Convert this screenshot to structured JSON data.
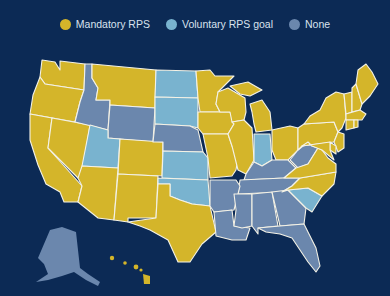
{
  "legend": {
    "items": [
      {
        "label": "Mandatory RPS",
        "color": "#d4b52a",
        "icon": "yellow-dot-icon"
      },
      {
        "label": "Voluntary RPS goal",
        "color": "#79b3cf",
        "icon": "light-blue-dot-icon"
      },
      {
        "label": "None",
        "color": "#6b87ad",
        "icon": "slate-blue-dot-icon"
      }
    ]
  },
  "colors": {
    "background": "#0c2a55",
    "mandatory": "#d4b52a",
    "voluntary": "#79b3cf",
    "none": "#6b87ad",
    "border": "#f4f2e6"
  },
  "states": {
    "mandatory": [
      "WA",
      "OR",
      "CA",
      "NV",
      "AZ",
      "NM",
      "MT",
      "CO",
      "TX",
      "MN",
      "IA",
      "MO",
      "WI",
      "IL",
      "MI",
      "OH",
      "PA",
      "NY",
      "ME",
      "NH",
      "VT",
      "MA",
      "RI",
      "CT",
      "NJ",
      "DE",
      "MD",
      "DC",
      "NC",
      "HI"
    ],
    "voluntary": [
      "UT",
      "ND",
      "SD",
      "KS",
      "OK",
      "IN",
      "SC"
    ],
    "none": [
      "ID",
      "WY",
      "NE",
      "AR",
      "LA",
      "KY",
      "TN",
      "MS",
      "AL",
      "GA",
      "FL",
      "WV",
      "AK"
    ]
  }
}
